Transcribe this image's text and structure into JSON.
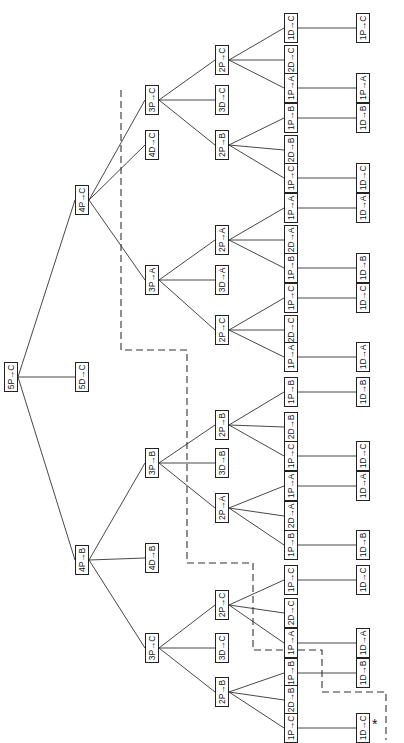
{
  "diagram": {
    "type": "tree",
    "orientation": "rotated-90-ccw",
    "root": "5P→C",
    "annotation_marker": "*",
    "nodes": [
      {
        "id": "n0",
        "label": "5P→C",
        "x": 11,
        "y": 377
      },
      {
        "id": "n1",
        "label": "4P→C",
        "x": 82,
        "y": 200
      },
      {
        "id": "n2",
        "label": "5D→C",
        "x": 82,
        "y": 377
      },
      {
        "id": "n3",
        "label": "4P→B",
        "x": 82,
        "y": 560
      },
      {
        "id": "n4",
        "label": "3P→C",
        "x": 152,
        "y": 100
      },
      {
        "id": "n5",
        "label": "4D→C",
        "x": 152,
        "y": 145
      },
      {
        "id": "n6",
        "label": "3P→A",
        "x": 152,
        "y": 280
      },
      {
        "id": "n7",
        "label": "3P→B",
        "x": 152,
        "y": 463
      },
      {
        "id": "n8",
        "label": "4D→B",
        "x": 152,
        "y": 558
      },
      {
        "id": "n9",
        "label": "3P→C",
        "x": 152,
        "y": 648
      },
      {
        "id": "n10",
        "label": "2P→C",
        "x": 222,
        "y": 60
      },
      {
        "id": "n11",
        "label": "3D→C",
        "x": 222,
        "y": 100
      },
      {
        "id": "n12",
        "label": "2P→B",
        "x": 222,
        "y": 145
      },
      {
        "id": "n13",
        "label": "2P→A",
        "x": 222,
        "y": 240
      },
      {
        "id": "n14",
        "label": "3D→A",
        "x": 222,
        "y": 280
      },
      {
        "id": "n15",
        "label": "2P→C",
        "x": 222,
        "y": 330
      },
      {
        "id": "n16",
        "label": "2P→B",
        "x": 222,
        "y": 425
      },
      {
        "id": "n17",
        "label": "3D→B",
        "x": 222,
        "y": 463
      },
      {
        "id": "n18",
        "label": "2P→A",
        "x": 222,
        "y": 508
      },
      {
        "id": "n19",
        "label": "2P→C",
        "x": 222,
        "y": 605
      },
      {
        "id": "n20",
        "label": "3D→C",
        "x": 222,
        "y": 648
      },
      {
        "id": "n21",
        "label": "2P→B",
        "x": 222,
        "y": 692
      },
      {
        "id": "n22",
        "label": "1D→C",
        "x": 291,
        "y": 28
      },
      {
        "id": "n23",
        "label": "2D→C",
        "x": 291,
        "y": 60
      },
      {
        "id": "n24",
        "label": "1P→A",
        "x": 291,
        "y": 88
      },
      {
        "id": "n25",
        "label": "1P→B",
        "x": 291,
        "y": 118
      },
      {
        "id": "n26",
        "label": "2D→B",
        "x": 291,
        "y": 150
      },
      {
        "id": "n27",
        "label": "1P→C",
        "x": 291,
        "y": 178
      },
      {
        "id": "n28",
        "label": "1P→A",
        "x": 291,
        "y": 208
      },
      {
        "id": "n29",
        "label": "2D→A",
        "x": 291,
        "y": 240
      },
      {
        "id": "n30",
        "label": "1P→B",
        "x": 291,
        "y": 268
      },
      {
        "id": "n31",
        "label": "1P→C",
        "x": 291,
        "y": 298
      },
      {
        "id": "n32",
        "label": "2D→C",
        "x": 291,
        "y": 330
      },
      {
        "id": "n33",
        "label": "1P→A",
        "x": 291,
        "y": 357
      },
      {
        "id": "n34",
        "label": "1P→B",
        "x": 291,
        "y": 392
      },
      {
        "id": "n35",
        "label": "2D→B",
        "x": 291,
        "y": 427
      },
      {
        "id": "n36",
        "label": "1P→C",
        "x": 291,
        "y": 456
      },
      {
        "id": "n37",
        "label": "1P→A",
        "x": 291,
        "y": 486
      },
      {
        "id": "n38",
        "label": "2D→A",
        "x": 291,
        "y": 516
      },
      {
        "id": "n39",
        "label": "1P→B",
        "x": 291,
        "y": 545
      },
      {
        "id": "n40",
        "label": "1P→C",
        "x": 291,
        "y": 580
      },
      {
        "id": "n41",
        "label": "2D→C",
        "x": 291,
        "y": 613
      },
      {
        "id": "n42",
        "label": "1P→A",
        "x": 291,
        "y": 643
      },
      {
        "id": "n43",
        "label": "1P→B",
        "x": 291,
        "y": 673
      },
      {
        "id": "n44",
        "label": "2D→B",
        "x": 291,
        "y": 700
      },
      {
        "id": "n45",
        "label": "1P→C",
        "x": 291,
        "y": 728
      },
      {
        "id": "n46",
        "label": "1P→C",
        "x": 363,
        "y": 28
      },
      {
        "id": "n47",
        "label": "1P→A",
        "x": 363,
        "y": 88
      },
      {
        "id": "n48",
        "label": "1D→B",
        "x": 363,
        "y": 118
      },
      {
        "id": "n49",
        "label": "1D→C",
        "x": 363,
        "y": 178
      },
      {
        "id": "n50",
        "label": "1D→A",
        "x": 363,
        "y": 208
      },
      {
        "id": "n51",
        "label": "1D→B",
        "x": 363,
        "y": 268
      },
      {
        "id": "n52",
        "label": "1D→C",
        "x": 363,
        "y": 298
      },
      {
        "id": "n53",
        "label": "1D→A",
        "x": 363,
        "y": 357
      },
      {
        "id": "n54",
        "label": "1D→B",
        "x": 363,
        "y": 392
      },
      {
        "id": "n55",
        "label": "1D→C",
        "x": 363,
        "y": 456
      },
      {
        "id": "n56",
        "label": "1D→A",
        "x": 363,
        "y": 486
      },
      {
        "id": "n57",
        "label": "1D→B",
        "x": 363,
        "y": 545
      },
      {
        "id": "n58",
        "label": "1D→C",
        "x": 363,
        "y": 580
      },
      {
        "id": "n59",
        "label": "1D→A",
        "x": 363,
        "y": 643
      },
      {
        "id": "n60",
        "label": "1D→B",
        "x": 363,
        "y": 673
      },
      {
        "id": "n61",
        "label": "1D→C",
        "x": 363,
        "y": 728
      }
    ],
    "edges": [
      [
        "n0",
        "n1"
      ],
      [
        "n0",
        "n2"
      ],
      [
        "n0",
        "n3"
      ],
      [
        "n1",
        "n4"
      ],
      [
        "n1",
        "n5"
      ],
      [
        "n1",
        "n6"
      ],
      [
        "n3",
        "n7"
      ],
      [
        "n3",
        "n8"
      ],
      [
        "n3",
        "n9"
      ],
      [
        "n4",
        "n10"
      ],
      [
        "n4",
        "n11"
      ],
      [
        "n4",
        "n12"
      ],
      [
        "n6",
        "n13"
      ],
      [
        "n6",
        "n14"
      ],
      [
        "n6",
        "n15"
      ],
      [
        "n7",
        "n16"
      ],
      [
        "n7",
        "n17"
      ],
      [
        "n7",
        "n18"
      ],
      [
        "n9",
        "n19"
      ],
      [
        "n9",
        "n20"
      ],
      [
        "n9",
        "n21"
      ],
      [
        "n10",
        "n22"
      ],
      [
        "n10",
        "n23"
      ],
      [
        "n10",
        "n24"
      ],
      [
        "n12",
        "n25"
      ],
      [
        "n12",
        "n26"
      ],
      [
        "n12",
        "n27"
      ],
      [
        "n13",
        "n28"
      ],
      [
        "n13",
        "n29"
      ],
      [
        "n13",
        "n30"
      ],
      [
        "n15",
        "n31"
      ],
      [
        "n15",
        "n32"
      ],
      [
        "n15",
        "n33"
      ],
      [
        "n16",
        "n34"
      ],
      [
        "n16",
        "n35"
      ],
      [
        "n16",
        "n36"
      ],
      [
        "n18",
        "n37"
      ],
      [
        "n18",
        "n38"
      ],
      [
        "n18",
        "n39"
      ],
      [
        "n19",
        "n40"
      ],
      [
        "n19",
        "n41"
      ],
      [
        "n19",
        "n42"
      ],
      [
        "n21",
        "n43"
      ],
      [
        "n21",
        "n44"
      ],
      [
        "n21",
        "n45"
      ],
      [
        "n22",
        "n46"
      ],
      [
        "n24",
        "n47"
      ],
      [
        "n25",
        "n48"
      ],
      [
        "n27",
        "n49"
      ],
      [
        "n28",
        "n50"
      ],
      [
        "n30",
        "n51"
      ],
      [
        "n31",
        "n52"
      ],
      [
        "n33",
        "n53"
      ],
      [
        "n34",
        "n54"
      ],
      [
        "n36",
        "n55"
      ],
      [
        "n37",
        "n56"
      ],
      [
        "n39",
        "n57"
      ],
      [
        "n40",
        "n58"
      ],
      [
        "n42",
        "n59"
      ],
      [
        "n43",
        "n60"
      ],
      [
        "n45",
        "n61"
      ]
    ],
    "dashed_path": [
      [
        121,
        90
      ],
      [
        121,
        350
      ],
      [
        187,
        350
      ],
      [
        187,
        563
      ],
      [
        253,
        563
      ],
      [
        253,
        650
      ],
      [
        322,
        650
      ],
      [
        322,
        692
      ],
      [
        386,
        692
      ],
      [
        386,
        740
      ]
    ],
    "star_position": {
      "x": 372,
      "y": 722
    }
  }
}
